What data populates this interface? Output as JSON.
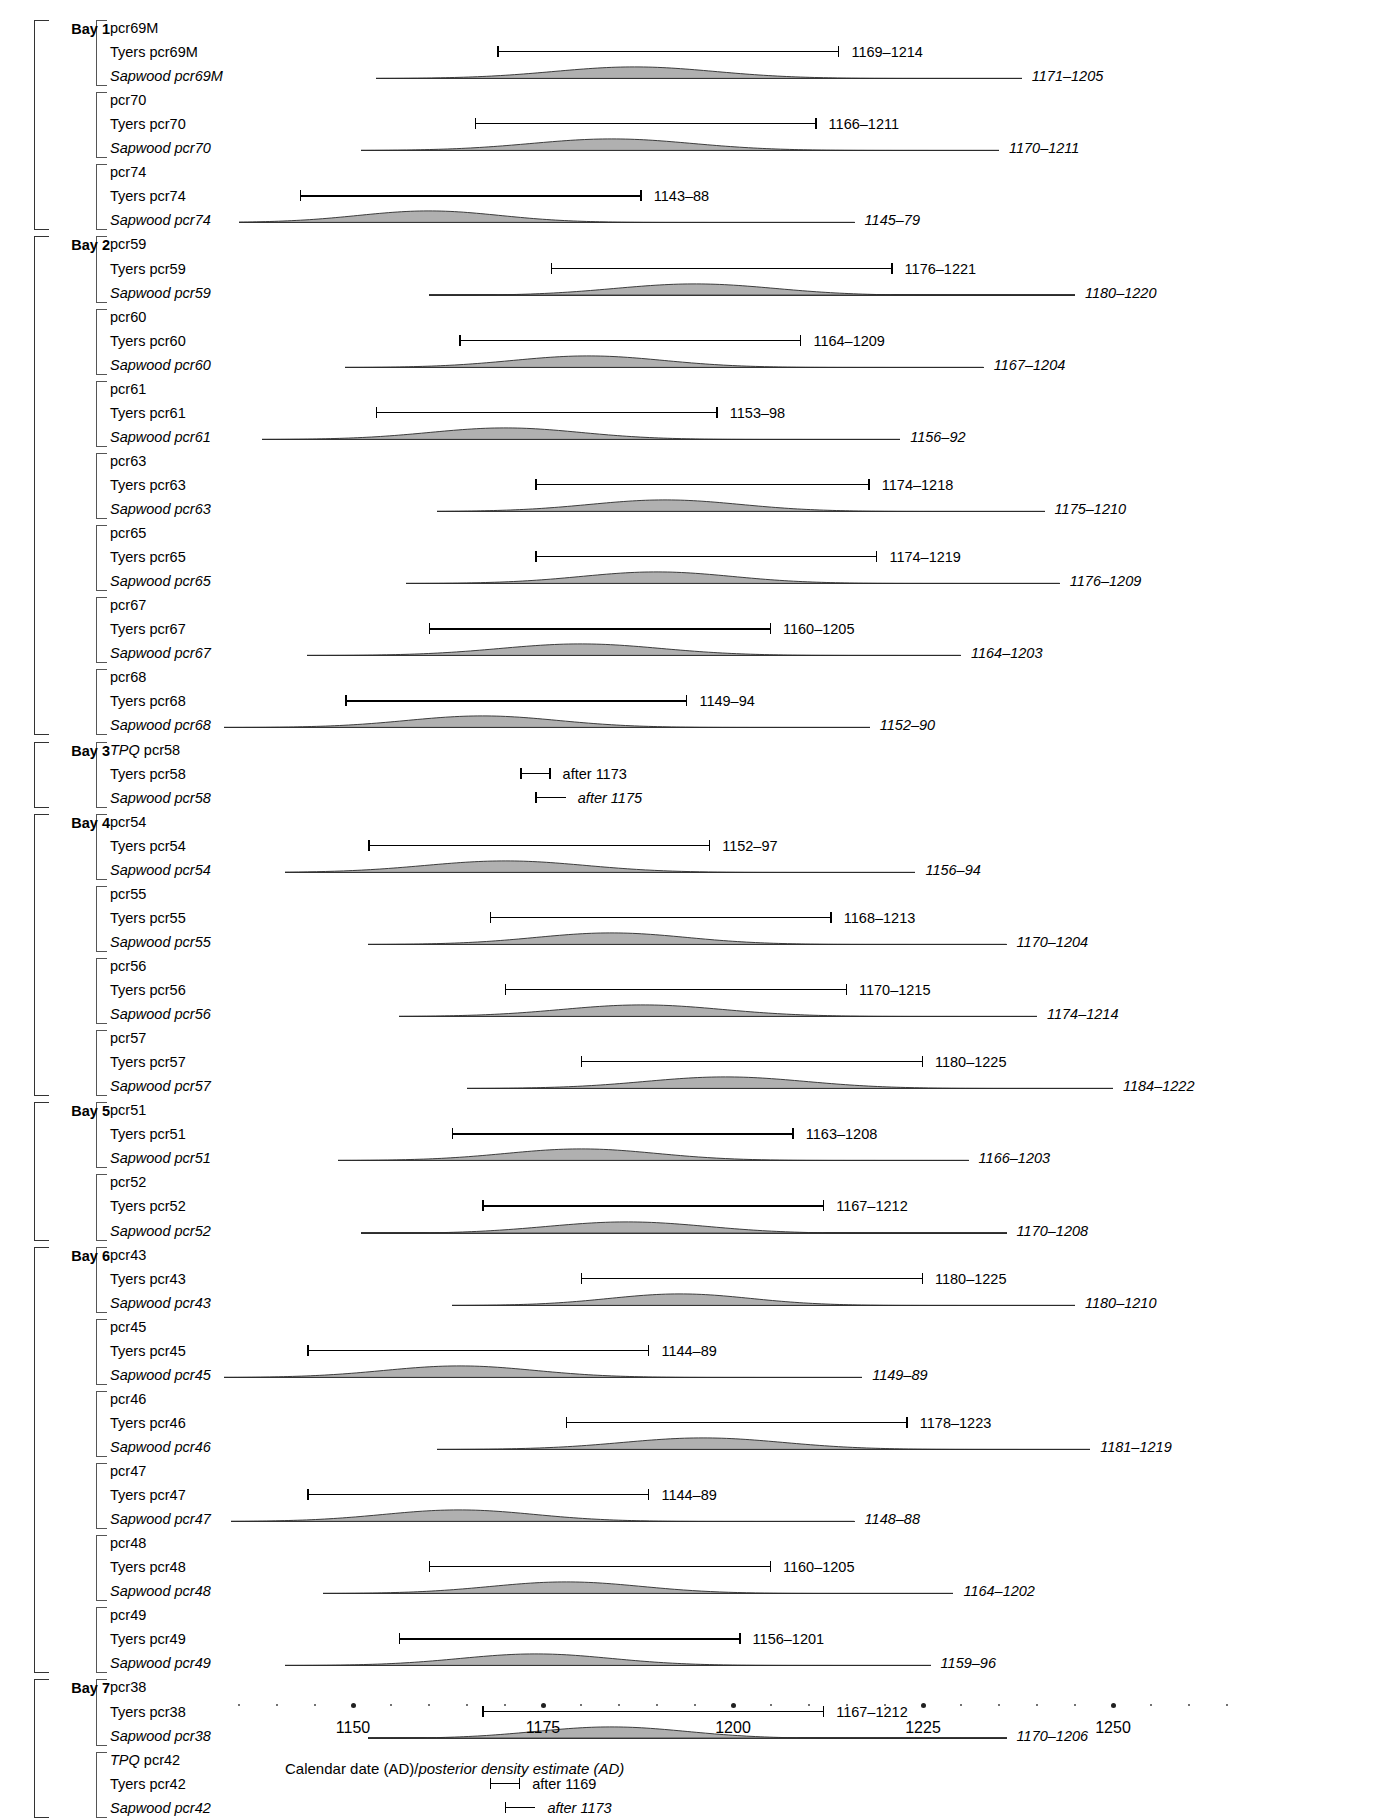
{
  "figure": {
    "axis": {
      "title_plain": "Calendar date (AD)/",
      "title_italic": "posterior density estimate (AD)",
      "tick_labels": [
        "1150",
        "1175",
        "1200",
        "1225",
        "1250"
      ],
      "tick_values": [
        1150,
        1175,
        1200,
        1225,
        1250
      ],
      "minor_step": 5,
      "range_min": 1135,
      "range_max": 1265,
      "px_per_year": 7.6,
      "x_origin_year": 1150,
      "x_origin_px": 353
    },
    "labels": {
      "prefix_tyers": "Tyers ",
      "prefix_sapwood": "Sapwood ",
      "prefix_tpq": "TPQ "
    },
    "bays": [
      {
        "name": "Bay 1",
        "groups": [
          {
            "id": "pcr69M",
            "tpq": false,
            "tyers": {
              "label_range": "1169–1214",
              "start": 1169,
              "end": 1214
            },
            "sapwood": {
              "label_range": "1171–1205",
              "start": 1171,
              "end": 1205,
              "base_start": 1153,
              "base_end": 1238,
              "peak": 1187,
              "spread": 17,
              "height": 10
            }
          },
          {
            "id": "pcr70",
            "tpq": false,
            "tyers": {
              "label_range": "1166–1211",
              "start": 1166,
              "end": 1211
            },
            "sapwood": {
              "label_range": "1170–1211",
              "start": 1170,
              "end": 1211,
              "base_start": 1151,
              "base_end": 1235,
              "peak": 1184,
              "spread": 17,
              "height": 10
            }
          },
          {
            "id": "pcr74",
            "tpq": false,
            "tyers": {
              "label_range": "1143–88",
              "start": 1143,
              "end": 1188
            },
            "sapwood": {
              "label_range": "1145–79",
              "start": 1145,
              "end": 1179,
              "base_start": 1135,
              "base_end": 1216,
              "peak": 1160,
              "spread": 15,
              "height": 10
            }
          }
        ]
      },
      {
        "name": "Bay 2",
        "groups": [
          {
            "id": "pcr59",
            "tpq": false,
            "tyers": {
              "label_range": "1176–1221",
              "start": 1176,
              "end": 1221
            },
            "sapwood": {
              "label_range": "1180–1220",
              "start": 1180,
              "end": 1220,
              "base_start": 1160,
              "base_end": 1245,
              "peak": 1195,
              "spread": 17,
              "height": 10
            }
          },
          {
            "id": "pcr60",
            "tpq": false,
            "tyers": {
              "label_range": "1164–1209",
              "start": 1164,
              "end": 1209
            },
            "sapwood": {
              "label_range": "1167–1204",
              "start": 1167,
              "end": 1204,
              "base_start": 1149,
              "base_end": 1233,
              "peak": 1181,
              "spread": 16,
              "height": 10
            }
          },
          {
            "id": "pcr61",
            "tpq": false,
            "tyers": {
              "label_range": "1153–98",
              "start": 1153,
              "end": 1198
            },
            "sapwood": {
              "label_range": "1156–92",
              "start": 1156,
              "end": 1192,
              "base_start": 1138,
              "base_end": 1222,
              "peak": 1170,
              "spread": 16,
              "height": 10
            }
          },
          {
            "id": "pcr63",
            "tpq": false,
            "tyers": {
              "label_range": "1174–1218",
              "start": 1174,
              "end": 1218
            },
            "sapwood": {
              "label_range": "1175–1210",
              "start": 1175,
              "end": 1210,
              "base_start": 1161,
              "base_end": 1241,
              "peak": 1191,
              "spread": 16,
              "height": 10
            }
          },
          {
            "id": "pcr65",
            "tpq": false,
            "tyers": {
              "label_range": "1174–1219",
              "start": 1174,
              "end": 1219
            },
            "sapwood": {
              "label_range": "1176–1209",
              "start": 1176,
              "end": 1209,
              "base_start": 1157,
              "base_end": 1243,
              "peak": 1190,
              "spread": 16,
              "height": 10
            }
          },
          {
            "id": "pcr67",
            "tpq": false,
            "tyers": {
              "label_range": "1160–1205",
              "start": 1160,
              "end": 1205
            },
            "sapwood": {
              "label_range": "1164–1203",
              "start": 1164,
              "end": 1203,
              "base_start": 1144,
              "base_end": 1230,
              "peak": 1180,
              "spread": 17,
              "height": 10
            }
          },
          {
            "id": "pcr68",
            "tpq": false,
            "tyers": {
              "label_range": "1149–94",
              "start": 1149,
              "end": 1194
            },
            "sapwood": {
              "label_range": "1152–90",
              "start": 1152,
              "end": 1190,
              "base_start": 1133,
              "base_end": 1218,
              "peak": 1167,
              "spread": 16,
              "height": 10
            }
          }
        ]
      },
      {
        "name": "Bay 3",
        "groups": [
          {
            "id": "pcr58",
            "tpq": true,
            "tyers": {
              "label_range": "after 1173",
              "start": 1172,
              "end": 1176
            },
            "sapwood": {
              "label_range": "after 1175",
              "start": 1174,
              "end": 1178,
              "tpq_marker": true
            }
          }
        ]
      },
      {
        "name": "Bay 4",
        "groups": [
          {
            "id": "pcr54",
            "tpq": false,
            "tyers": {
              "label_range": "1152–97",
              "start": 1152,
              "end": 1197
            },
            "sapwood": {
              "label_range": "1156–94",
              "start": 1156,
              "end": 1194,
              "base_start": 1141,
              "base_end": 1224,
              "peak": 1170,
              "spread": 17,
              "height": 10
            }
          },
          {
            "id": "pcr55",
            "tpq": false,
            "tyers": {
              "label_range": "1168–1213",
              "start": 1168,
              "end": 1213
            },
            "sapwood": {
              "label_range": "1170–1204",
              "start": 1170,
              "end": 1204,
              "base_start": 1152,
              "base_end": 1236,
              "peak": 1184,
              "spread": 16,
              "height": 10
            }
          },
          {
            "id": "pcr56",
            "tpq": false,
            "tyers": {
              "label_range": "1170–1215",
              "start": 1170,
              "end": 1215
            },
            "sapwood": {
              "label_range": "1174–1214",
              "start": 1174,
              "end": 1214,
              "base_start": 1156,
              "base_end": 1240,
              "peak": 1188,
              "spread": 17,
              "height": 10
            }
          },
          {
            "id": "pcr57",
            "tpq": false,
            "tyers": {
              "label_range": "1180–1225",
              "start": 1180,
              "end": 1225
            },
            "sapwood": {
              "label_range": "1184–1222",
              "start": 1184,
              "end": 1222,
              "base_start": 1165,
              "base_end": 1250,
              "peak": 1199,
              "spread": 17,
              "height": 10
            }
          }
        ]
      },
      {
        "name": "Bay 5",
        "groups": [
          {
            "id": "pcr51",
            "tpq": false,
            "tyers": {
              "label_range": "1163–1208",
              "start": 1163,
              "end": 1208
            },
            "sapwood": {
              "label_range": "1166–1203",
              "start": 1166,
              "end": 1203,
              "base_start": 1148,
              "base_end": 1231,
              "peak": 1180,
              "spread": 16,
              "height": 10
            }
          },
          {
            "id": "pcr52",
            "tpq": false,
            "tyers": {
              "label_range": "1167–1212",
              "start": 1167,
              "end": 1212
            },
            "sapwood": {
              "label_range": "1170–1208",
              "start": 1170,
              "end": 1208,
              "base_start": 1151,
              "base_end": 1236,
              "peak": 1186,
              "spread": 17,
              "height": 10
            }
          }
        ]
      },
      {
        "name": "Bay 6",
        "groups": [
          {
            "id": "pcr43",
            "tpq": false,
            "tyers": {
              "label_range": "1180–1225",
              "start": 1180,
              "end": 1225
            },
            "sapwood": {
              "label_range": "1180–1210",
              "start": 1180,
              "end": 1210,
              "base_start": 1163,
              "base_end": 1245,
              "peak": 1193,
              "spread": 15,
              "height": 10
            }
          },
          {
            "id": "pcr45",
            "tpq": false,
            "tyers": {
              "label_range": "1144–89",
              "start": 1144,
              "end": 1189
            },
            "sapwood": {
              "label_range": "1149–89",
              "start": 1149,
              "end": 1189,
              "base_start": 1133,
              "base_end": 1217,
              "peak": 1164,
              "spread": 16,
              "height": 10
            }
          },
          {
            "id": "pcr46",
            "tpq": false,
            "tyers": {
              "label_range": "1178–1223",
              "start": 1178,
              "end": 1223
            },
            "sapwood": {
              "label_range": "1181–1219",
              "start": 1181,
              "end": 1219,
              "base_start": 1161,
              "base_end": 1247,
              "peak": 1196,
              "spread": 17,
              "height": 10
            }
          },
          {
            "id": "pcr47",
            "tpq": false,
            "tyers": {
              "label_range": "1144–89",
              "start": 1144,
              "end": 1189
            },
            "sapwood": {
              "label_range": "1148–88",
              "start": 1148,
              "end": 1188,
              "base_start": 1134,
              "base_end": 1216,
              "peak": 1164,
              "spread": 16,
              "height": 10
            }
          },
          {
            "id": "pcr48",
            "tpq": false,
            "tyers": {
              "label_range": "1160–1205",
              "start": 1160,
              "end": 1205
            },
            "sapwood": {
              "label_range": "1164–1202",
              "start": 1164,
              "end": 1202,
              "base_start": 1146,
              "base_end": 1229,
              "peak": 1178,
              "spread": 16,
              "height": 10
            }
          },
          {
            "id": "pcr49",
            "tpq": false,
            "tyers": {
              "label_range": "1156–1201",
              "start": 1156,
              "end": 1201
            },
            "sapwood": {
              "label_range": "1159–96",
              "start": 1159,
              "end": 1196,
              "base_start": 1141,
              "base_end": 1226,
              "peak": 1174,
              "spread": 16,
              "height": 10
            }
          }
        ]
      },
      {
        "name": "Bay 7",
        "groups": [
          {
            "id": "pcr38",
            "tpq": false,
            "tyers": {
              "label_range": "1167–1212",
              "start": 1167,
              "end": 1212
            },
            "sapwood": {
              "label_range": "1170–1206",
              "start": 1170,
              "end": 1206,
              "base_start": 1152,
              "base_end": 1236,
              "peak": 1184,
              "spread": 16,
              "height": 10
            }
          },
          {
            "id": "pcr42",
            "tpq": true,
            "tyers": {
              "label_range": "after 1169",
              "start": 1168,
              "end": 1172
            },
            "sapwood": {
              "label_range": "after 1173",
              "start": 1170,
              "end": 1174,
              "tpq_marker": true
            }
          }
        ]
      },
      {
        "name": "Bay 8",
        "groups": [
          {
            "id": "pcr36",
            "tpq": true,
            "tyers": {
              "label_range": "after 1166",
              "start": 1165,
              "end": 1169
            },
            "sapwood": {
              "label_range": "after 1167",
              "start": 1166,
              "end": 1170,
              "tpq_marker": true
            }
          }
        ]
      }
    ]
  }
}
